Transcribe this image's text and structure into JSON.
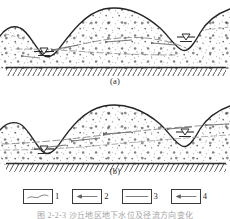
{
  "figure": {
    "type": "scanned-technical-diagram",
    "rendering": "grayscale halftone scan",
    "panels": [
      {
        "id": "a",
        "label": "(a)",
        "description": "Dune / sand body cross-section with water table mounding beneath the dune crest and two ponded low points at left and right."
      },
      {
        "id": "b",
        "label": "(b)",
        "description": "Same cross-section with a sloping water table and lateral groundwater flow arrows directed toward the left low point."
      }
    ],
    "legend": {
      "items": [
        {
          "number": "1",
          "symbol": "curved-line",
          "meaning": "ground surface / dune profile line"
        },
        {
          "number": "2",
          "symbol": "line-with-left-arrow",
          "meaning": "groundwater flow direction"
        },
        {
          "number": "3",
          "symbol": "plain-horizontal-line",
          "meaning": "water table line"
        },
        {
          "number": "4",
          "symbol": "line-with-arrow",
          "meaning": "seepage / discharge direction"
        }
      ]
    },
    "caption": "图 2-2-3  沙丘地区地下水位及径流方向变化",
    "colors": {
      "ink": "#2b2b2b",
      "stipple": "#6e6e6e",
      "water_line": "#8a8a8a",
      "paper": "#ffffff",
      "bedrock": "#3a3a3a"
    },
    "markers": {
      "water_level_symbol": "inverted-triangle-with-bar",
      "bedrock_symbol": "diagonal-hatching-below-line"
    }
  }
}
